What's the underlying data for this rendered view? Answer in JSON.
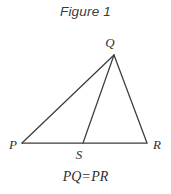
{
  "figure": {
    "title": "Figure 1",
    "caption": "PQ = PR",
    "caption_parts": {
      "left_term": "PQ",
      "relation": "=",
      "right_term": "PR"
    },
    "background_color": "#ffffff",
    "line_color": "#3c3c3c",
    "text_color": "#2f2f2f"
  },
  "diagram": {
    "type": "triangle-with-cevian",
    "vertices": [
      {
        "id": "P",
        "label": "P",
        "x": 22,
        "y": 143,
        "label_x": 9,
        "label_y": 149,
        "role": "base-left"
      },
      {
        "id": "Q",
        "label": "Q",
        "x": 114,
        "y": 55,
        "label_x": 110,
        "label_y": 47,
        "role": "apex"
      },
      {
        "id": "R",
        "label": "R",
        "x": 147,
        "y": 143,
        "label_x": 153,
        "label_y": 149,
        "role": "base-right"
      },
      {
        "id": "S",
        "label": "S",
        "x": 83,
        "y": 143,
        "label_x": 79,
        "label_y": 159,
        "role": "base-point"
      }
    ],
    "segments": [
      {
        "id": "PQ",
        "from": "P",
        "to": "Q",
        "name": "side-pq"
      },
      {
        "id": "QR",
        "from": "Q",
        "to": "R",
        "name": "side-qr"
      },
      {
        "id": "PR",
        "from": "P",
        "to": "R",
        "name": "base-pr"
      },
      {
        "id": "QS",
        "from": "Q",
        "to": "S",
        "name": "cevian-qs"
      }
    ],
    "labels": {
      "P": "P",
      "Q": "Q",
      "R": "R",
      "S": "S"
    }
  }
}
